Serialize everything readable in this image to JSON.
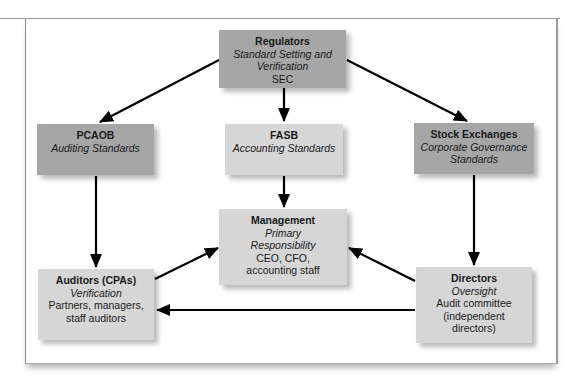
{
  "diagram": {
    "type": "relationship-flow",
    "nodes": {
      "regulators": {
        "title": "Regulators",
        "role": "Standard Setting and Verification",
        "detail": "SEC"
      },
      "pcaob": {
        "title": "PCAOB",
        "role": "Auditing Standards",
        "detail": ""
      },
      "fasb": {
        "title": "FASB",
        "role": "Accounting Standards",
        "detail": ""
      },
      "stock_exchanges": {
        "title": "Stock Exchanges",
        "role": "Corporate Governance Standards",
        "detail": ""
      },
      "management": {
        "title": "Management",
        "role": "Primary Responsibility",
        "detail": "CEO, CFO, accounting staff"
      },
      "auditors": {
        "title": "Auditors (CPAs)",
        "role": "Verification",
        "detail": "Partners, managers, staff auditors"
      },
      "directors": {
        "title": "Directors",
        "role": "Oversight",
        "detail": "Audit committee (independent directors)"
      }
    },
    "edges": [
      {
        "from": "regulators",
        "to": "pcaob"
      },
      {
        "from": "regulators",
        "to": "fasb"
      },
      {
        "from": "regulators",
        "to": "stock_exchanges"
      },
      {
        "from": "pcaob",
        "to": "auditors"
      },
      {
        "from": "fasb",
        "to": "management"
      },
      {
        "from": "stock_exchanges",
        "to": "directors"
      },
      {
        "from": "auditors",
        "to": "management"
      },
      {
        "from": "directors",
        "to": "management"
      },
      {
        "from": "directors",
        "to": "auditors"
      }
    ],
    "colors": {
      "dark_box": "#a6a6a6",
      "light_box": "#d6d6d6",
      "arrow": "#000000"
    }
  }
}
